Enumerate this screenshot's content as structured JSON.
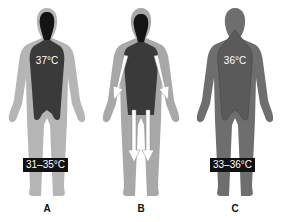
{
  "figures": [
    {
      "id": "A",
      "letter": "A",
      "core_temp": "37°C",
      "shell_temp": "31–35°C"
    },
    {
      "id": "B",
      "letter": "B",
      "core_temp": "",
      "shell_temp": ""
    },
    {
      "id": "C",
      "letter": "C",
      "core_temp": "36°C",
      "shell_temp": "33–36°C"
    }
  ],
  "colors": {
    "shell_light": "#b5b5b5",
    "shell_medium": "#8e8e8e",
    "core_dark": "#3a3a3a",
    "head_black": "#141414",
    "label_box": "#111111",
    "arrow": "#ffffff"
  }
}
